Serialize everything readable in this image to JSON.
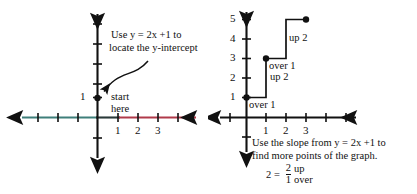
{
  "figure": {
    "background_color": "#ffffff",
    "ink_color": "#111111",
    "axis_negative_color": "#3f7f7a",
    "axis_positive_color": "#b03a4a"
  },
  "left_panel": {
    "name": "locate-y-intercept-graph",
    "annotation_line1": "Use y = 2x +1 to",
    "annotation_line2": "locate the y-intercept",
    "callout_line1": "start",
    "callout_line2": "here",
    "y_axis_labels": [
      "1"
    ],
    "x_axis_labels": [
      "1",
      "2",
      "3"
    ],
    "y_intercept_point": {
      "x": 0,
      "y": 1
    }
  },
  "right_panel": {
    "name": "slope-staircase-graph",
    "y_axis_labels": [
      "1",
      "2",
      "3",
      "4",
      "5"
    ],
    "x_axis_labels": [
      "1",
      "2",
      "3"
    ],
    "step_labels": {
      "over_1_lower": "over 1",
      "up_2_lower": "up 2",
      "over_1_upper": "over 1",
      "up_2_upper": "up 2"
    },
    "points": [
      {
        "x": 0,
        "y": 1
      },
      {
        "x": 1,
        "y": 3
      },
      {
        "x": 2,
        "y": 5
      }
    ],
    "caption_line1": "Use the slope from y = 2x +1 to",
    "caption_line2": "find more points of the graph.",
    "slope_equation": {
      "lhs": "2 =",
      "numerator": "2",
      "denominator": "1",
      "rhs_top": "up",
      "rhs_bottom": "over"
    }
  }
}
